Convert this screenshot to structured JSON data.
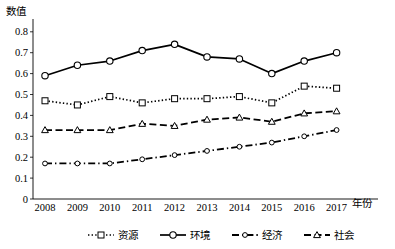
{
  "chart_data": {
    "type": "line",
    "title": "",
    "ylabel": "数值",
    "xlabel": "年份",
    "categories": [
      "2008",
      "2009",
      "2010",
      "2011",
      "2012",
      "2013",
      "2014",
      "2015",
      "2016",
      "2017"
    ],
    "ylim": [
      0,
      0.8
    ],
    "yticks": [
      "0",
      "0.1",
      "0.2",
      "0.3",
      "0.4",
      "0.5",
      "0.6",
      "0.7",
      "0.8"
    ],
    "ytick_values": [
      0,
      0.1,
      0.2,
      0.3,
      0.4,
      0.5,
      0.6,
      0.7,
      0.8
    ],
    "grid": false,
    "legend_position": "bottom",
    "series": [
      {
        "name": "资源",
        "marker": "square",
        "line_style": "dotted",
        "color": "#000000",
        "values": [
          0.47,
          0.45,
          0.49,
          0.46,
          0.48,
          0.48,
          0.49,
          0.46,
          0.54,
          0.53
        ]
      },
      {
        "name": "环境",
        "marker": "circle",
        "line_style": "solid",
        "color": "#000000",
        "values": [
          0.59,
          0.64,
          0.66,
          0.71,
          0.74,
          0.68,
          0.67,
          0.6,
          0.66,
          0.7
        ]
      },
      {
        "name": "经济",
        "marker": "small-circle",
        "line_style": "dash-dot",
        "color": "#000000",
        "values": [
          0.17,
          0.17,
          0.17,
          0.19,
          0.21,
          0.23,
          0.25,
          0.27,
          0.3,
          0.33
        ]
      },
      {
        "name": "社会",
        "marker": "triangle",
        "line_style": "dashed",
        "color": "#000000",
        "values": [
          0.33,
          0.33,
          0.33,
          0.36,
          0.35,
          0.38,
          0.39,
          0.37,
          0.41,
          0.42
        ]
      }
    ]
  },
  "legend": {
    "entries": [
      {
        "label": "资源"
      },
      {
        "label": "环境"
      },
      {
        "label": "经济"
      },
      {
        "label": "社会"
      }
    ]
  }
}
